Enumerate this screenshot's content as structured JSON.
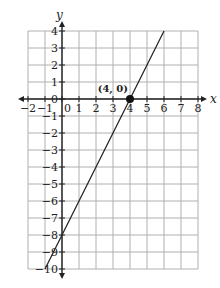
{
  "chart_data": {
    "type": "line",
    "title": "",
    "xlabel": "x",
    "ylabel": "y",
    "xlim": [
      -2,
      8
    ],
    "ylim": [
      -10,
      4
    ],
    "grid": true,
    "x_ticks": [
      "−2",
      "−1",
      "0",
      "1",
      "2",
      "3",
      "4",
      "5",
      "6",
      "7",
      "8"
    ],
    "y_ticks": [
      "4",
      "3",
      "2",
      "1",
      "0",
      "−1",
      "−2",
      "−3",
      "−4",
      "−5",
      "−6",
      "−7",
      "−8",
      "−9",
      "−10"
    ],
    "series": [
      {
        "name": "line",
        "equation": "y = 2x - 8",
        "x": [
          -1,
          6
        ],
        "y": [
          -10,
          4
        ]
      }
    ],
    "annotations": [
      {
        "label": "(4, 0)",
        "x": 4,
        "y": 0,
        "marker": "filled-circle"
      }
    ]
  }
}
